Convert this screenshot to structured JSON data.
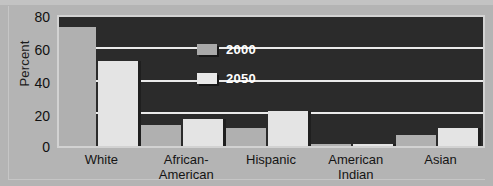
{
  "chart_data": {
    "type": "bar",
    "title": "",
    "xlabel": "",
    "ylabel": "Percent",
    "ylim": [
      0,
      80
    ],
    "yticks": [
      0,
      20,
      40,
      60,
      80
    ],
    "grid": true,
    "legend_position": "inside-top-left",
    "categories": [
      "White",
      "African-American",
      "Hispanic",
      "American Indian",
      "Asian"
    ],
    "category_lines": [
      {
        "line1": "White",
        "line2": ""
      },
      {
        "line1": "African-",
        "line2": "American"
      },
      {
        "line1": "Hispanic",
        "line2": ""
      },
      {
        "line1": "American",
        "line2": "Indian"
      },
      {
        "line1": "Asian",
        "line2": ""
      }
    ],
    "series": [
      {
        "name": "2000",
        "color": "#b0b0b0",
        "values": [
          74,
          13,
          11,
          1,
          7
        ]
      },
      {
        "name": "2050",
        "color": "#e4e4e4",
        "values": [
          53,
          17,
          22,
          1.5,
          11
        ]
      }
    ]
  },
  "axis": {
    "y_title": "Percent",
    "y_tick_labels": [
      "80",
      "60",
      "40",
      "20",
      "0"
    ]
  },
  "legend": {
    "items": [
      {
        "label": "2000",
        "swatch": "medium-gray"
      },
      {
        "label": "2050",
        "swatch": "light-gray"
      }
    ]
  },
  "colors": {
    "figure_background": "#b4b4b4",
    "plot_background": "#2b2b2b",
    "gridline": "#eaeaea",
    "plot_border": "#d2d2d2",
    "series_2000": "#b0b0b0",
    "series_2050": "#e4e4e4",
    "text": "#141414",
    "legend_text": "#ffffff"
  }
}
